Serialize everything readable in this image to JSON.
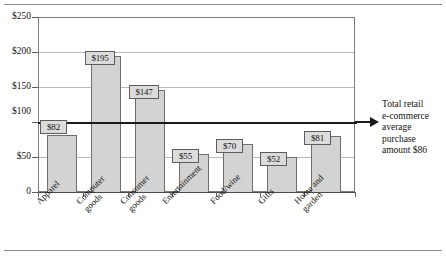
{
  "chart_data": {
    "type": "bar",
    "title": "",
    "subtitle": "",
    "xlabel": "",
    "ylabel": "",
    "ylim": [
      0,
      250
    ],
    "grid": true,
    "legend": "none",
    "categories": [
      "Apparel",
      "Computer goods",
      "Consumer goods",
      "Entertainment",
      "Food/wine",
      "Gifts",
      "Home and garden"
    ],
    "category_lines": [
      [
        "Apparel"
      ],
      [
        "Computer",
        "goods"
      ],
      [
        "Consumer",
        "goods"
      ],
      [
        "Entertainment"
      ],
      [
        "Food/wine"
      ],
      [
        "Gifts"
      ],
      [
        "Home and",
        "garden"
      ]
    ],
    "values": [
      82,
      195,
      147,
      55,
      70,
      52,
      81
    ],
    "value_labels": [
      "$82",
      "$195",
      "$147",
      "$55",
      "$70",
      "$52",
      "$81"
    ],
    "ytick_values": [
      0,
      50,
      100,
      150,
      200,
      250
    ],
    "ytick_labels": [
      "0",
      "$50",
      "$100",
      "$150",
      "$200",
      "$250"
    ],
    "reference_line": {
      "value": 86,
      "label": "Total retail e-commerce average purchase amount $86"
    },
    "colors": {
      "bar_fill": "#d3d3d3",
      "bar_stroke": "#6f6f6f",
      "gridline": "#b8b8b8",
      "axis": "#4a4a4a",
      "reference_line": "#1b1b1b",
      "label_box_fill": "#dcdcdc",
      "text": "#111111"
    }
  },
  "annotation": {
    "line1": "Total retail",
    "line2": "e-commerce",
    "line3": "average",
    "line4": "purchase",
    "line5": "amount $86"
  }
}
